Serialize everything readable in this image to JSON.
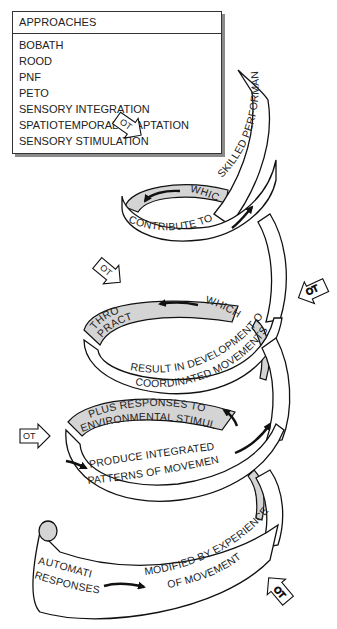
{
  "legend": {
    "title": "APPROACHES",
    "items": [
      "BOBATH",
      "ROOD",
      "PNF",
      "PETO",
      "SENSORY INTEGRATION",
      "SPATIOTEMPORAL ADAPTATION",
      "SENSORY STIMULATION"
    ]
  },
  "spiral": {
    "top": {
      "outer": "SKILLED PERFORMANCE",
      "front": "CONTRIBUTE TO",
      "inner": "WHICH"
    },
    "second": {
      "inner_left_1": "THROUGH",
      "inner_left_2": "PRACTICE",
      "inner_right": "WHICH",
      "front_1": "RESULT IN DEVELOPMENT OF",
      "front_2": "COORDINATED MOVEMENTS"
    },
    "third": {
      "inner_1": "PLUS RESPONSES TO",
      "inner_2": "ENVIRONMENTAL STIMULI",
      "front_1": "PRODUCE INTEGRATED",
      "front_2": "PATTERNS OF MOVEMENT"
    },
    "bottom": {
      "left_1": "AUTOMATIC",
      "left_2": "RESPONSES",
      "right_1": "MODIFIED BY EXPERIENCE",
      "right_2": "OF MOVEMENT"
    }
  },
  "ot_label": "OT"
}
